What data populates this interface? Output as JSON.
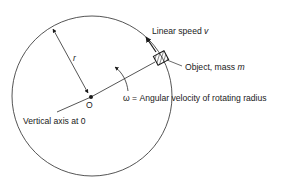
{
  "diagram": {
    "labels": {
      "radius": "r",
      "linear_speed_prefix": "Linear speed ",
      "linear_speed_var": "v",
      "object_prefix": "Object, mass ",
      "object_var": "m",
      "omega": "ω = Angular velocity of rotating radius",
      "center": "O",
      "axis": "Vertical axis at 0"
    },
    "colors": {
      "stroke": "#2a2a2a",
      "text": "#1a1a1a",
      "background": "#ffffff"
    }
  }
}
